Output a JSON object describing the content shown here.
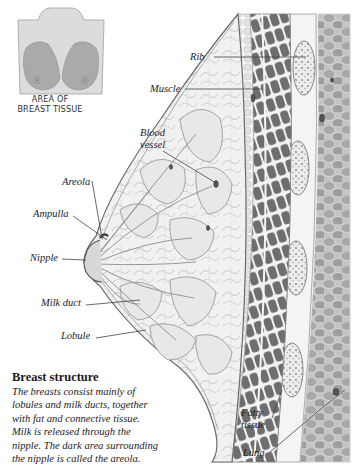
{
  "inset": {
    "caption_line1": "AREA OF",
    "caption_line2": "BREAST TISSUE",
    "colors": {
      "torso": "#d9d9d9",
      "breast_area": "#a9a9a9",
      "outline": "#8a8a8a"
    }
  },
  "labels": {
    "rib": "Rib",
    "muscle": "Muscle",
    "blood_vessel_1": "Blood",
    "blood_vessel_2": "vessel",
    "areola": "Areola",
    "ampulla": "Ampulla",
    "nipple": "Nipple",
    "milk_duct": "Milk duct",
    "lobule": "Lobule",
    "fatty_tissue_1": "Fatty",
    "fatty_tissue_2": "tissue",
    "lung": "Lung"
  },
  "caption": {
    "title": "Breast structure",
    "lines": [
      "The breasts consist mainly of",
      "lobules and milk ducts, together",
      "with fat and connective tissue.",
      "Milk is released through the",
      "nipple. The dark area surrounding",
      "the nipple is called the areola."
    ]
  },
  "colors": {
    "lung": "#b8b8b8",
    "muscle": "#6f6f6f",
    "rib": "#e6e6e6",
    "gland": "#ededed",
    "leader_line": "#444444"
  }
}
